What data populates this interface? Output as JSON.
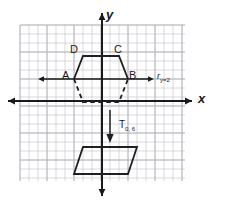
{
  "figure": {
    "kind": "coordinate-grid-transformation-diagram",
    "axes": {
      "x_label": "x",
      "y_label": "y"
    },
    "grid": {
      "cell_px": 9,
      "left": 20,
      "top": 25,
      "right": 185,
      "bottom": 181,
      "cols": 18,
      "rows": 17,
      "line_color": "#c9c9cf",
      "bold_line_color": "#b0b0b8",
      "bold_every": 3
    },
    "colors": {
      "ink": "#1f1f1f",
      "grid": "#c9c9cf",
      "grid_bold": "#b0b0b8",
      "axis": "#1a1a1a"
    },
    "vertex_labels": [
      {
        "name": "A",
        "text": "A"
      },
      {
        "name": "B",
        "text": "B"
      },
      {
        "name": "C",
        "text": "C"
      },
      {
        "name": "D",
        "text": "D"
      }
    ],
    "operations": [
      {
        "name": "reflection",
        "symbol": "r",
        "subscript": "y=2"
      },
      {
        "name": "translation",
        "symbol": "T",
        "subscript": "0, 6"
      }
    ],
    "shapes": {
      "preimage_trapezoid": "solid trapezoid A B C D above reflection line",
      "reflected_trapezoid": "dashed trapezoid below reflection line",
      "translated_trapezoid": "solid trapezoid near bottom of grid"
    }
  }
}
